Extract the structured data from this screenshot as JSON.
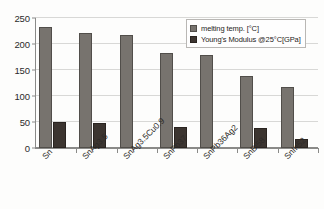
{
  "chart_data": {
    "type": "bar",
    "title": "",
    "xlabel": "",
    "ylabel": "",
    "ylim": [
      0,
      250
    ],
    "yticks": [
      0,
      50,
      100,
      150,
      200,
      250
    ],
    "grid": true,
    "legend_position": "top-right",
    "categories": [
      "Sn",
      "SnAg3.5",
      "SnAg3.5Cu0.9",
      "SnPb37",
      "SnPb36Ag2",
      "SnBi58",
      "SnIn52"
    ],
    "series": [
      {
        "name": "melting temp. [°C]",
        "color": "#77736e",
        "values": [
          232,
          221,
          217,
          183,
          178,
          138,
          118
        ]
      },
      {
        "name": "Young's Modulus @25°C[GPa]",
        "color": "#3c3530",
        "values": [
          50,
          49,
          0,
          40,
          0,
          38,
          17
        ]
      }
    ]
  },
  "legend": {
    "items": [
      {
        "label": "melting temp. [°C]"
      },
      {
        "label": "Young's Modulus @25°C[GPa]"
      }
    ]
  }
}
